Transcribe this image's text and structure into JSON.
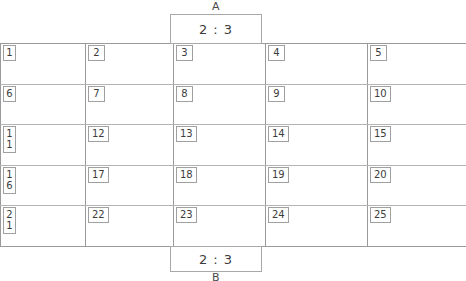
{
  "diagram": {
    "title_top": "A",
    "title_bottom": "B",
    "terminal_top_value": "2 : 3",
    "terminal_bottom_value": "2 : 3",
    "border_color": "#9a9a9a",
    "row_divider_color": "#b4b4b4",
    "text_color": "#3c3c3c",
    "background": "#ffffff",
    "columns": 5,
    "rows": 5,
    "cells": [
      [
        {
          "id": "1"
        },
        {
          "id": "2"
        },
        {
          "id": "3"
        },
        {
          "id": "4"
        },
        {
          "id": "5"
        }
      ],
      [
        {
          "id": "6"
        },
        {
          "id": "7"
        },
        {
          "id": "8"
        },
        {
          "id": "9"
        },
        {
          "id": "10"
        }
      ],
      [
        {
          "id": "11"
        },
        {
          "id": "12"
        },
        {
          "id": "13"
        },
        {
          "id": "14"
        },
        {
          "id": "15"
        }
      ],
      [
        {
          "id": "16"
        },
        {
          "id": "17"
        },
        {
          "id": "18"
        },
        {
          "id": "19"
        },
        {
          "id": "20"
        }
      ],
      [
        {
          "id": "21"
        },
        {
          "id": "22"
        },
        {
          "id": "23"
        },
        {
          "id": "24"
        },
        {
          "id": "25"
        }
      ]
    ]
  }
}
